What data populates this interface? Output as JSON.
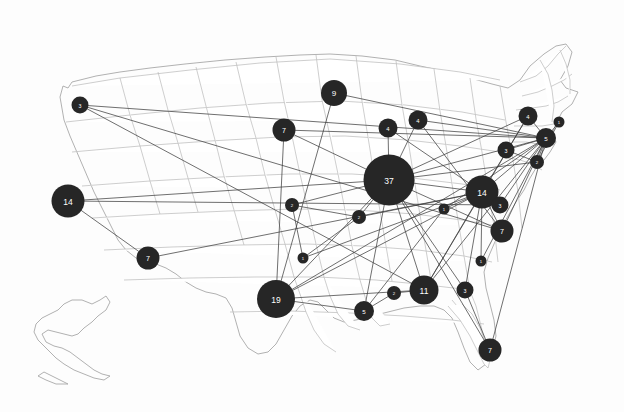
{
  "map": {
    "title": "United States proportional symbol map with connection lines",
    "background_color": "#fdfdfd",
    "state_fill": "#ffffff",
    "state_border_color": "#b9b9b9",
    "node_color": "#262626",
    "node_label_color": "#ffffff",
    "edge_color": "#3a3a3a",
    "width": 624,
    "height": 412
  },
  "chart_data": {
    "type": "scatter",
    "xlabel": "",
    "ylabel": "",
    "legend": "none",
    "grid": false,
    "nodes": [
      {
        "id": "n1",
        "label": "3",
        "value": 3,
        "x": 80,
        "y": 105,
        "r": 8.5
      },
      {
        "id": "n2",
        "label": "14",
        "value": 14,
        "x": 68,
        "y": 201,
        "r": 16.5
      },
      {
        "id": "n3",
        "label": "7",
        "value": 7,
        "x": 148,
        "y": 258,
        "r": 11.5
      },
      {
        "id": "n4",
        "label": "7",
        "value": 7,
        "x": 284,
        "y": 130,
        "r": 11.5
      },
      {
        "id": "n5",
        "label": "9",
        "value": 9,
        "x": 334,
        "y": 93,
        "r": 13.0
      },
      {
        "id": "n6",
        "label": "4",
        "value": 4,
        "x": 388,
        "y": 128,
        "r": 9.5
      },
      {
        "id": "n7",
        "label": "4",
        "value": 4,
        "x": 418,
        "y": 120,
        "r": 9.5
      },
      {
        "id": "n8",
        "label": "37",
        "value": 37,
        "x": 389,
        "y": 180,
        "r": 25.5
      },
      {
        "id": "n9",
        "label": "2",
        "value": 2,
        "x": 292,
        "y": 205,
        "r": 7.0
      },
      {
        "id": "n10",
        "label": "2",
        "value": 2,
        "x": 359,
        "y": 217,
        "r": 7.0
      },
      {
        "id": "n11",
        "label": "1",
        "value": 1,
        "x": 303,
        "y": 258,
        "r": 5.5
      },
      {
        "id": "n12",
        "label": "19",
        "value": 19,
        "x": 276,
        "y": 299,
        "r": 19.0
      },
      {
        "id": "n13",
        "label": "5",
        "value": 5,
        "x": 364,
        "y": 311,
        "r": 10.0
      },
      {
        "id": "n14",
        "label": "2",
        "value": 2,
        "x": 394,
        "y": 293,
        "r": 7.0
      },
      {
        "id": "n15",
        "label": "11",
        "value": 11,
        "x": 424,
        "y": 290,
        "r": 14.5
      },
      {
        "id": "n16",
        "label": "3",
        "value": 3,
        "x": 465,
        "y": 290,
        "r": 8.5
      },
      {
        "id": "n17",
        "label": "7",
        "value": 7,
        "x": 490,
        "y": 350,
        "r": 11.5
      },
      {
        "id": "n18",
        "label": "1",
        "value": 1,
        "x": 444,
        "y": 209,
        "r": 5.5
      },
      {
        "id": "n19",
        "label": "1",
        "value": 1,
        "x": 481,
        "y": 261,
        "r": 5.5
      },
      {
        "id": "n20",
        "label": "14",
        "value": 14,
        "x": 482,
        "y": 192,
        "r": 16.5
      },
      {
        "id": "n21",
        "label": "3",
        "value": 3,
        "x": 500,
        "y": 205,
        "r": 8.5
      },
      {
        "id": "n22",
        "label": "7",
        "value": 7,
        "x": 502,
        "y": 231,
        "r": 11.5
      },
      {
        "id": "n23",
        "label": "3",
        "value": 3,
        "x": 506,
        "y": 150,
        "r": 8.5
      },
      {
        "id": "n24",
        "label": "2",
        "value": 2,
        "x": 537,
        "y": 162,
        "r": 7.0
      },
      {
        "id": "n25",
        "label": "5",
        "value": 5,
        "x": 546,
        "y": 138,
        "r": 10.0
      },
      {
        "id": "n26",
        "label": "4",
        "value": 4,
        "x": 528,
        "y": 116,
        "r": 9.5
      },
      {
        "id": "n27",
        "label": "1",
        "value": 1,
        "x": 559,
        "y": 122,
        "r": 5.5
      }
    ],
    "edges": [
      [
        "n1",
        "n25"
      ],
      [
        "n1",
        "n15"
      ],
      [
        "n1",
        "n22"
      ],
      [
        "n2",
        "n3"
      ],
      [
        "n2",
        "n21"
      ],
      [
        "n2",
        "n8"
      ],
      [
        "n3",
        "n20"
      ],
      [
        "n4",
        "n12"
      ],
      [
        "n4",
        "n8"
      ],
      [
        "n4",
        "n25"
      ],
      [
        "n5",
        "n12"
      ],
      [
        "n5",
        "n25"
      ],
      [
        "n6",
        "n8"
      ],
      [
        "n6",
        "n20"
      ],
      [
        "n7",
        "n8"
      ],
      [
        "n7",
        "n25"
      ],
      [
        "n7",
        "n22"
      ],
      [
        "n8",
        "n9"
      ],
      [
        "n8",
        "n10"
      ],
      [
        "n8",
        "n12"
      ],
      [
        "n8",
        "n13"
      ],
      [
        "n8",
        "n15"
      ],
      [
        "n8",
        "n20"
      ],
      [
        "n8",
        "n25"
      ],
      [
        "n8",
        "n24"
      ],
      [
        "n8",
        "n26"
      ],
      [
        "n8",
        "n17"
      ],
      [
        "n8",
        "n16"
      ],
      [
        "n8",
        "n22"
      ],
      [
        "n9",
        "n10"
      ],
      [
        "n9",
        "n11"
      ],
      [
        "n10",
        "n11"
      ],
      [
        "n10",
        "n20"
      ],
      [
        "n11",
        "n20"
      ],
      [
        "n12",
        "n13"
      ],
      [
        "n12",
        "n15"
      ],
      [
        "n12",
        "n20"
      ],
      [
        "n12",
        "n25"
      ],
      [
        "n13",
        "n14"
      ],
      [
        "n13",
        "n18"
      ],
      [
        "n14",
        "n15"
      ],
      [
        "n15",
        "n20"
      ],
      [
        "n15",
        "n25"
      ],
      [
        "n15",
        "n26"
      ],
      [
        "n16",
        "n17"
      ],
      [
        "n16",
        "n20"
      ],
      [
        "n18",
        "n20"
      ],
      [
        "n18",
        "n25"
      ],
      [
        "n19",
        "n20"
      ],
      [
        "n19",
        "n25"
      ],
      [
        "n20",
        "n21"
      ],
      [
        "n20",
        "n22"
      ],
      [
        "n20",
        "n25"
      ],
      [
        "n20",
        "n26"
      ],
      [
        "n21",
        "n25"
      ],
      [
        "n23",
        "n24"
      ],
      [
        "n23",
        "n25"
      ],
      [
        "n24",
        "n25"
      ],
      [
        "n24",
        "n27"
      ],
      [
        "n25",
        "n26"
      ],
      [
        "n25",
        "n27"
      ],
      [
        "n25",
        "n22"
      ],
      [
        "n25",
        "n17"
      ]
    ]
  }
}
